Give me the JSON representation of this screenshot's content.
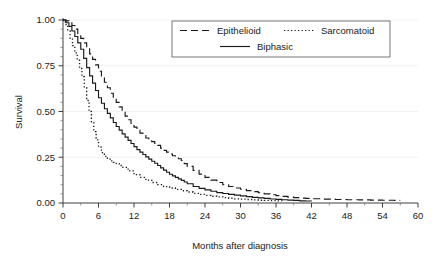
{
  "chart_data": {
    "type": "line",
    "title": "",
    "subtitle": "",
    "xlabel": "Months after diagnosis",
    "ylabel": "Survival",
    "xlim": [
      0,
      60
    ],
    "ylim": [
      0,
      1.0
    ],
    "xticks": [
      0,
      6,
      12,
      18,
      24,
      30,
      36,
      42,
      48,
      54,
      60
    ],
    "xtick_labels": [
      "0",
      "6",
      "12",
      "18",
      "24",
      "30",
      "36",
      "42",
      "48",
      "54",
      "60"
    ],
    "yticks": [
      0.0,
      0.25,
      0.5,
      0.75,
      1.0
    ],
    "ytick_labels": [
      "0.00",
      "0.25",
      "0.50",
      "0.75",
      "1.00"
    ],
    "x_minor_tick_step": 3,
    "y_minor_tick_step": 0.05,
    "grid": "faint-horizontal",
    "legend_position": "top-center",
    "series": [
      {
        "name": "Epithelioid",
        "style": "dashed",
        "color": "#1a1a1a",
        "x": [
          0,
          0.5,
          1,
          1.5,
          2,
          2.5,
          3,
          3.5,
          4,
          4.5,
          5,
          5.5,
          6,
          6.5,
          7,
          7.5,
          8,
          8.5,
          9,
          9.5,
          10,
          10.5,
          11,
          11.5,
          12,
          12.5,
          13,
          13.5,
          14,
          14.5,
          15,
          15.5,
          16,
          16.5,
          17,
          17.5,
          18,
          18.5,
          19,
          19.5,
          20,
          20.5,
          21,
          22,
          23,
          24,
          25,
          26,
          27,
          28,
          29,
          30,
          31,
          32,
          33,
          34,
          35,
          36,
          37,
          38,
          39,
          40,
          41,
          42,
          44,
          46,
          48,
          50,
          52,
          54,
          56,
          57
        ],
        "y": [
          1.0,
          0.995,
          0.985,
          0.97,
          0.95,
          0.925,
          0.9,
          0.875,
          0.845,
          0.815,
          0.785,
          0.755,
          0.72,
          0.69,
          0.66,
          0.63,
          0.6,
          0.575,
          0.55,
          0.525,
          0.5,
          0.475,
          0.455,
          0.435,
          0.415,
          0.398,
          0.382,
          0.368,
          0.355,
          0.345,
          0.335,
          0.325,
          0.315,
          0.3,
          0.288,
          0.278,
          0.268,
          0.258,
          0.25,
          0.242,
          0.232,
          0.215,
          0.2,
          0.178,
          0.158,
          0.14,
          0.125,
          0.112,
          0.1,
          0.09,
          0.082,
          0.075,
          0.068,
          0.062,
          0.056,
          0.05,
          0.045,
          0.04,
          0.036,
          0.032,
          0.029,
          0.027,
          0.025,
          0.023,
          0.021,
          0.019,
          0.018,
          0.017,
          0.016,
          0.015,
          0.014,
          0.014
        ]
      },
      {
        "name": "Sarcomatoid",
        "style": "dotted",
        "color": "#1a1a1a",
        "x": [
          0,
          0.4,
          0.8,
          1.2,
          1.6,
          2,
          2.4,
          2.8,
          3.2,
          3.6,
          4,
          4.4,
          4.8,
          5.2,
          5.6,
          6,
          6.5,
          7,
          7.5,
          8,
          8.5,
          9,
          9.5,
          10,
          11,
          12,
          13,
          14,
          15,
          16,
          17,
          18,
          19,
          20,
          21,
          22,
          23,
          24,
          25,
          26,
          27,
          28,
          29,
          30,
          31,
          32,
          33,
          34,
          35,
          36,
          37
        ],
        "y": [
          1.0,
          0.975,
          0.94,
          0.9,
          0.86,
          0.82,
          0.78,
          0.735,
          0.69,
          0.63,
          0.56,
          0.5,
          0.44,
          0.39,
          0.345,
          0.305,
          0.275,
          0.255,
          0.24,
          0.23,
          0.222,
          0.215,
          0.205,
          0.195,
          0.175,
          0.155,
          0.14,
          0.125,
          0.112,
          0.1,
          0.09,
          0.082,
          0.074,
          0.067,
          0.06,
          0.053,
          0.047,
          0.042,
          0.037,
          0.033,
          0.029,
          0.026,
          0.023,
          0.021,
          0.019,
          0.017,
          0.015,
          0.014,
          0.013,
          0.012,
          0.011
        ]
      },
      {
        "name": "Biphasic",
        "style": "solid",
        "color": "#1a1a1a",
        "x": [
          0,
          0.5,
          1,
          1.5,
          2,
          2.5,
          3,
          3.5,
          4,
          4.5,
          5,
          5.5,
          6,
          6.5,
          7,
          7.5,
          8,
          8.5,
          9,
          9.5,
          10,
          10.5,
          11,
          11.5,
          12,
          12.5,
          13,
          13.5,
          14,
          14.5,
          15,
          15.5,
          16,
          16.5,
          17,
          17.5,
          18,
          18.5,
          19,
          19.5,
          20,
          20.5,
          21,
          22,
          23,
          24,
          25,
          26,
          27,
          28,
          29,
          30,
          31,
          32,
          33,
          34,
          35,
          36,
          37,
          38,
          39,
          40,
          41,
          42
        ],
        "y": [
          1.0,
          0.985,
          0.965,
          0.94,
          0.91,
          0.875,
          0.84,
          0.79,
          0.74,
          0.695,
          0.655,
          0.615,
          0.575,
          0.545,
          0.515,
          0.49,
          0.465,
          0.44,
          0.418,
          0.398,
          0.378,
          0.36,
          0.342,
          0.325,
          0.308,
          0.292,
          0.278,
          0.265,
          0.252,
          0.24,
          0.228,
          0.217,
          0.205,
          0.192,
          0.18,
          0.168,
          0.157,
          0.148,
          0.14,
          0.132,
          0.124,
          0.115,
          0.105,
          0.09,
          0.08,
          0.072,
          0.064,
          0.057,
          0.052,
          0.047,
          0.043,
          0.039,
          0.035,
          0.031,
          0.028,
          0.025,
          0.022,
          0.02,
          0.018,
          0.016,
          0.014,
          0.012,
          0.011,
          0.01
        ]
      }
    ]
  },
  "legend": {
    "entries": [
      {
        "label": "Epithelioid",
        "style": "dashed"
      },
      {
        "label": "Sarcomatoid",
        "style": "dotted"
      },
      {
        "label": "Biphasic",
        "style": "solid"
      }
    ]
  },
  "axes": {
    "x_title": "Months after diagnosis",
    "y_title": "Survival"
  }
}
